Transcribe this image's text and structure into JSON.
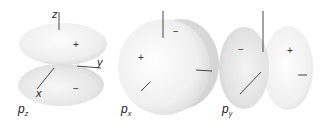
{
  "figure": {
    "orbitals": [
      {
        "id": "pz",
        "label": "p",
        "subscript": "z",
        "axes": {
          "z": "z",
          "y": "y",
          "x": "x"
        },
        "lobes": [
          {
            "position": "upper",
            "sign": "+"
          },
          {
            "position": "lower",
            "sign": "−"
          }
        ]
      },
      {
        "id": "px",
        "label": "p",
        "subscript": "x",
        "lobes": [
          {
            "position": "front",
            "sign": "+"
          },
          {
            "position": "back",
            "sign": "−"
          }
        ]
      },
      {
        "id": "py",
        "label": "p",
        "subscript": "y",
        "lobes": [
          {
            "position": "left",
            "sign": "−"
          },
          {
            "position": "right",
            "sign": "+"
          }
        ]
      }
    ],
    "colors": {
      "lobe_light": "#f7f7f7",
      "lobe_shade": "#dcdcdc",
      "axis": "#333333"
    }
  }
}
